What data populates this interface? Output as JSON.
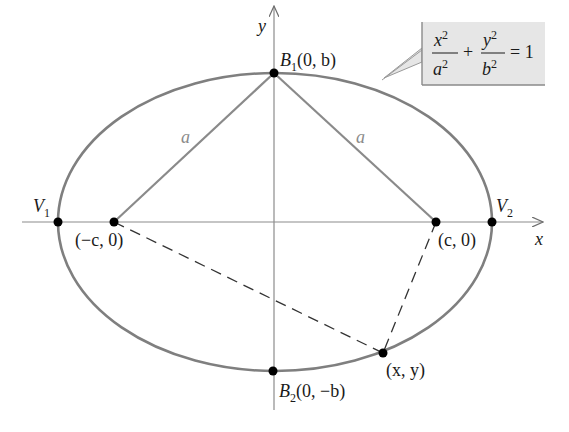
{
  "figure": {
    "equation": {
      "lhs_term1_num": "x",
      "lhs_term1_num_exp": "2",
      "lhs_term1_den": "a",
      "lhs_term1_den_exp": "2",
      "plus": "+",
      "lhs_term2_num": "y",
      "lhs_term2_num_exp": "2",
      "lhs_term2_den": "b",
      "lhs_term2_den_exp": "2",
      "equals": "= 1"
    },
    "axes": {
      "x_label": "x",
      "y_label": "y"
    },
    "points": {
      "B1": {
        "name": "B",
        "sub": "1",
        "coords": "(0, b)"
      },
      "B2": {
        "name": "B",
        "sub": "2",
        "coords": "(0, −b)"
      },
      "V1": {
        "name": "V",
        "sub": "1"
      },
      "V2": {
        "name": "V",
        "sub": "2"
      },
      "F1": {
        "coords": "(−c, 0)"
      },
      "F2": {
        "coords": "(c, 0)"
      },
      "P": {
        "coords": "(x, y)"
      }
    },
    "segment_labels": {
      "left": "a",
      "right": "a"
    },
    "colors": {
      "curve": "#7f7f7f",
      "axis": "#8c8c8c",
      "point": "#000000",
      "callout_fill": "#e6e6e6",
      "callout_border": "#9a9a9a",
      "text": "#1a1a1a",
      "segment_label": "#8a8a8a"
    }
  }
}
